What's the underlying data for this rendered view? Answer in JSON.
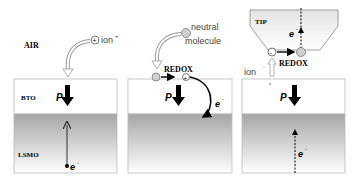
{
  "panels": [
    {
      "labels": {
        "ambient": "AIR",
        "top_layer": "BTO",
        "bottom_layer": "LSMO"
      },
      "species": {
        "name": "ion",
        "charge": "+"
      },
      "polarization": "P",
      "carrier": {
        "name": "e",
        "charge": "-"
      }
    },
    {
      "species": {
        "name": "neutral molecule",
        "line1": "neutral",
        "line2": "molecule"
      },
      "reaction": "REDOX",
      "reaction_product_charge": "+",
      "polarization": "P",
      "carrier": {
        "name": "e",
        "charge": "-"
      }
    },
    {
      "tip_label": "TIP",
      "species": {
        "name": "ion",
        "charge": "-"
      },
      "reaction": "REDOX",
      "reactant_charge": "-",
      "polarization": "P",
      "carrier_tip": {
        "name": "e",
        "charge": "-"
      },
      "carrier_substrate": {
        "name": "e",
        "charge": "-"
      }
    }
  ],
  "colors": {
    "arrow": "#000000",
    "bto_fill": "#ffffff",
    "lsmo_top": "#a8a8a8",
    "lsmo_bottom": "#ffffff",
    "circle_fill": "#d0d0d0",
    "curved_arrow": "#e8e8e8"
  }
}
